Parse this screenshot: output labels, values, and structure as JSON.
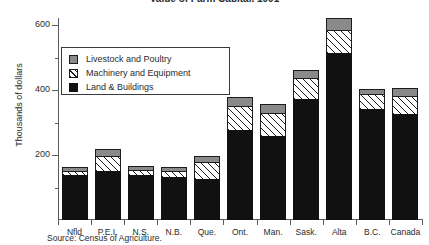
{
  "chart_data": {
    "type": "bar",
    "subtype": "stacked",
    "title": "Value of Farm Capital, 1991",
    "xlabel": "",
    "ylabel": "Thousands of dollars",
    "ylim": [
      0,
      680
    ],
    "yticks": [
      200,
      400,
      600
    ],
    "ytick_labels": [
      "200",
      "400",
      "600"
    ],
    "yminor_ticks": [
      100,
      300,
      500,
      700
    ],
    "grid": false,
    "legend_position": "upper-left-inside",
    "categories": [
      "Nfld",
      "P.E.I.",
      "N.S.",
      "N.B.",
      "Que.",
      "Ont.",
      "Man.",
      "Sask.",
      "Alta",
      "B.C.",
      "Canada"
    ],
    "series": [
      {
        "name": "Land & Buildings",
        "color": "#111111",
        "values": [
          140,
          150,
          140,
          133,
          125,
          277,
          258,
          372,
          515,
          342,
          325
        ]
      },
      {
        "name": "Machinery and Equipment",
        "color": "#ffffff",
        "pattern": "diagonal-hatch",
        "values": [
          12,
          48,
          15,
          18,
          53,
          73,
          70,
          65,
          70,
          46,
          58
        ]
      },
      {
        "name": "Livestock and Poultry",
        "color": "#8a8a8a",
        "values": [
          12,
          22,
          10,
          12,
          19,
          28,
          28,
          25,
          37,
          15,
          22
        ]
      }
    ],
    "totals": [
      164,
      220,
      165,
      163,
      197,
      378,
      356,
      462,
      622,
      403,
      405
    ],
    "source": "Source: Census of Agriculture."
  },
  "legend": {
    "items": [
      {
        "label": "Livestock and Poultry",
        "swatch": "gray-swatch"
      },
      {
        "label": "Machinery and Equipment",
        "swatch": "hatched-swatch"
      },
      {
        "label": "Land & Buildings",
        "swatch": "black-swatch"
      }
    ]
  }
}
